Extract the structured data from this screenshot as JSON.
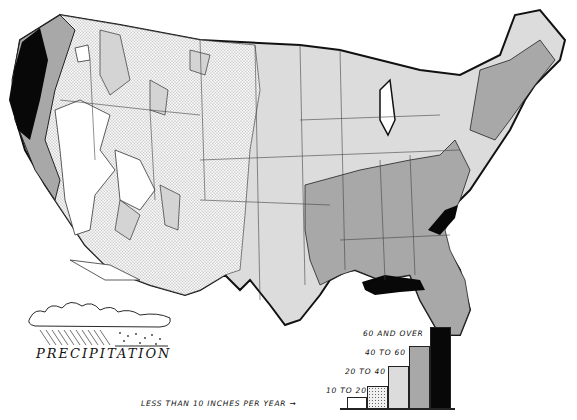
{
  "map": {
    "title": "PRECIPITATION",
    "subject": "Average annual precipitation, United States",
    "colors": {
      "lt10": "#ffffff",
      "10to20": "#ececec",
      "20to40": "#d9d9d9",
      "40to60": "#a8a8a8",
      "60plus": "#080808",
      "border": "#222222"
    }
  },
  "legend": {
    "items": [
      {
        "label": "LESS THAN 10 INCHES PER YEAR",
        "fill": "white"
      },
      {
        "label": "10 TO 20",
        "fill": "stippled"
      },
      {
        "label": "20 TO 40",
        "fill": "light-gray"
      },
      {
        "label": "40 TO 60",
        "fill": "medium-gray"
      },
      {
        "label": "60 AND OVER",
        "fill": "black"
      }
    ],
    "arrow": "→"
  }
}
